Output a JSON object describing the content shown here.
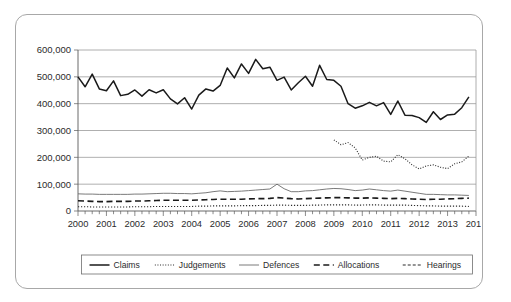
{
  "chart_data": {
    "type": "line",
    "title": "",
    "subtitle": "",
    "xlabel": "",
    "ylabel": "",
    "ylim": [
      0,
      600000
    ],
    "xlim": [
      2000,
      2014
    ],
    "grid": true,
    "legend_position": "bottom",
    "y_ticks": [
      0,
      100000,
      200000,
      300000,
      400000,
      500000,
      600000
    ],
    "y_tick_labels": [
      "0",
      "100,000",
      "200,000",
      "300,000",
      "400,000",
      "500,000",
      "600,000"
    ],
    "x_ticks": [
      2000,
      2001,
      2002,
      2003,
      2004,
      2005,
      2006,
      2007,
      2008,
      2009,
      2010,
      2011,
      2012,
      2013,
      2014
    ],
    "x_tick_labels": [
      "2000",
      "2001",
      "2002",
      "2003",
      "2004",
      "2005",
      "2006",
      "2007",
      "2008",
      "2009",
      "2010",
      "2011",
      "2012",
      "2013",
      "2014"
    ],
    "x_minor_interval": 0.25,
    "x_unit": "quarter",
    "series": [
      {
        "name": "Claims",
        "style": "solid",
        "width": 1.5,
        "color": "#1a1a1a",
        "x": [
          2000.0,
          2000.25,
          2000.5,
          2000.75,
          2001.0,
          2001.25,
          2001.5,
          2001.75,
          2002.0,
          2002.25,
          2002.5,
          2002.75,
          2003.0,
          2003.25,
          2003.5,
          2003.75,
          2004.0,
          2004.25,
          2004.5,
          2004.75,
          2005.0,
          2005.25,
          2005.5,
          2005.75,
          2006.0,
          2006.25,
          2006.5,
          2006.75,
          2007.0,
          2007.25,
          2007.5,
          2007.75,
          2008.0,
          2008.25,
          2008.5,
          2008.75,
          2009.0,
          2009.25,
          2009.5,
          2009.75,
          2010.0,
          2010.25,
          2010.5,
          2010.75,
          2011.0,
          2011.25,
          2011.5,
          2011.75,
          2012.0,
          2012.25,
          2012.5,
          2012.75,
          2013.0,
          2013.25,
          2013.5,
          2013.75
        ],
        "values": [
          500000,
          463000,
          510000,
          455000,
          448000,
          485000,
          430000,
          435000,
          451000,
          428000,
          452000,
          440000,
          452000,
          418000,
          399000,
          422000,
          380000,
          432000,
          455000,
          447000,
          468000,
          533000,
          496000,
          548000,
          513000,
          565000,
          530000,
          536000,
          487000,
          499000,
          451000,
          478000,
          502000,
          465000,
          543000,
          490000,
          487000,
          465000,
          400000,
          383000,
          392000,
          405000,
          392000,
          404000,
          360000,
          410000,
          357000,
          356000,
          348000,
          330000,
          370000,
          341000,
          358000,
          361000,
          385000,
          425000
        ]
      },
      {
        "name": "Judgements",
        "style": "dotted",
        "width": 1.1,
        "color": "#2b2b2b",
        "x": [
          2009.0,
          2009.25,
          2009.5,
          2009.75,
          2010.0,
          2010.25,
          2010.5,
          2010.75,
          2011.0,
          2011.25,
          2011.5,
          2011.75,
          2012.0,
          2012.25,
          2012.5,
          2012.75,
          2013.0,
          2013.25,
          2013.5,
          2013.75
        ],
        "values": [
          265000,
          247000,
          255000,
          235000,
          190000,
          200000,
          204000,
          186000,
          183000,
          210000,
          195000,
          172000,
          157000,
          168000,
          172000,
          163000,
          158000,
          176000,
          183000,
          205000
        ]
      },
      {
        "name": "Defences",
        "style": "solid-thin",
        "width": 0.9,
        "color": "#6b6b6b",
        "x": [
          2000.0,
          2000.25,
          2000.5,
          2000.75,
          2001.0,
          2001.25,
          2001.5,
          2001.75,
          2002.0,
          2002.25,
          2002.5,
          2002.75,
          2003.0,
          2003.25,
          2003.5,
          2003.75,
          2004.0,
          2004.25,
          2004.5,
          2004.75,
          2005.0,
          2005.25,
          2005.5,
          2005.75,
          2006.0,
          2006.25,
          2006.5,
          2006.75,
          2007.0,
          2007.25,
          2007.5,
          2007.75,
          2008.0,
          2008.25,
          2008.5,
          2008.75,
          2009.0,
          2009.25,
          2009.5,
          2009.75,
          2010.0,
          2010.25,
          2010.5,
          2010.75,
          2011.0,
          2011.25,
          2011.5,
          2011.75,
          2012.0,
          2012.25,
          2012.5,
          2012.75,
          2013.0,
          2013.25,
          2013.5,
          2013.75
        ],
        "values": [
          64000,
          63000,
          63000,
          62000,
          62000,
          62000,
          62000,
          62000,
          63000,
          63000,
          64000,
          65000,
          66000,
          66000,
          65000,
          65000,
          64000,
          66000,
          68000,
          72000,
          75000,
          72000,
          73000,
          74000,
          76000,
          78000,
          80000,
          82000,
          100000,
          83000,
          72000,
          72000,
          75000,
          76000,
          79000,
          82000,
          84000,
          83000,
          80000,
          76000,
          78000,
          82000,
          79000,
          76000,
          74000,
          78000,
          74000,
          70000,
          66000,
          62000,
          62000,
          61000,
          60000,
          60000,
          59000,
          58000
        ]
      },
      {
        "name": "Allocations",
        "style": "dashed",
        "width": 1.6,
        "color": "#1a1a1a",
        "x": [
          2000.0,
          2000.25,
          2000.5,
          2000.75,
          2001.0,
          2001.25,
          2001.5,
          2001.75,
          2002.0,
          2002.25,
          2002.5,
          2002.75,
          2003.0,
          2003.25,
          2003.5,
          2003.75,
          2004.0,
          2004.25,
          2004.5,
          2004.75,
          2005.0,
          2005.25,
          2005.5,
          2005.75,
          2006.0,
          2006.25,
          2006.5,
          2006.75,
          2007.0,
          2007.25,
          2007.5,
          2007.75,
          2008.0,
          2008.25,
          2008.5,
          2008.75,
          2009.0,
          2009.25,
          2009.5,
          2009.75,
          2010.0,
          2010.25,
          2010.5,
          2010.75,
          2011.0,
          2011.25,
          2011.5,
          2011.75,
          2012.0,
          2012.25,
          2012.5,
          2012.75,
          2013.0,
          2013.25,
          2013.5,
          2013.75
        ],
        "values": [
          38000,
          37000,
          36000,
          35000,
          35000,
          36000,
          36000,
          36000,
          37000,
          37000,
          38000,
          39000,
          40000,
          40000,
          40000,
          40000,
          40000,
          41000,
          42000,
          43000,
          44000,
          44000,
          44000,
          44000,
          45000,
          46000,
          46000,
          47000,
          50000,
          48000,
          46000,
          45000,
          46000,
          47000,
          48000,
          49000,
          50000,
          50000,
          49000,
          48000,
          48000,
          49000,
          48000,
          47000,
          46000,
          47000,
          46000,
          45000,
          44000,
          43000,
          44000,
          44000,
          45000,
          46000,
          47000,
          48000
        ]
      },
      {
        "name": "Hearings",
        "style": "dash-dot",
        "width": 1.1,
        "color": "#2b2b2b",
        "x": [
          2000.0,
          2000.25,
          2000.5,
          2000.75,
          2001.0,
          2001.25,
          2001.5,
          2001.75,
          2002.0,
          2002.25,
          2002.5,
          2002.75,
          2003.0,
          2003.25,
          2003.5,
          2003.75,
          2004.0,
          2004.25,
          2004.5,
          2004.75,
          2005.0,
          2005.25,
          2005.5,
          2005.75,
          2006.0,
          2006.25,
          2006.5,
          2006.75,
          2007.0,
          2007.25,
          2007.5,
          2007.75,
          2008.0,
          2008.25,
          2008.5,
          2008.75,
          2009.0,
          2009.25,
          2009.5,
          2009.75,
          2010.0,
          2010.25,
          2010.5,
          2010.75,
          2011.0,
          2011.25,
          2011.5,
          2011.75,
          2012.0,
          2012.25,
          2012.5,
          2012.75,
          2013.0,
          2013.25,
          2013.5,
          2013.75
        ],
        "values": [
          16000,
          16000,
          15000,
          15000,
          15000,
          15000,
          15000,
          15000,
          16000,
          16000,
          16000,
          17000,
          17000,
          17000,
          17000,
          17000,
          17000,
          18000,
          18000,
          19000,
          19000,
          19000,
          19000,
          20000,
          20000,
          20000,
          21000,
          21000,
          22000,
          22000,
          21000,
          21000,
          21000,
          22000,
          22000,
          23000,
          23000,
          23000,
          23000,
          22000,
          22000,
          23000,
          23000,
          22000,
          22000,
          22000,
          22000,
          21000,
          20000,
          19000,
          19000,
          18000,
          18000,
          18000,
          18000,
          17000
        ]
      }
    ]
  },
  "legend": {
    "entries": [
      {
        "label": "Claims",
        "style": "solid"
      },
      {
        "label": "Judgements",
        "style": "dotted"
      },
      {
        "label": "Defences",
        "style": "solid-thin"
      },
      {
        "label": "Allocations",
        "style": "dashed"
      },
      {
        "label": "Hearings",
        "style": "dash-dot"
      }
    ]
  }
}
